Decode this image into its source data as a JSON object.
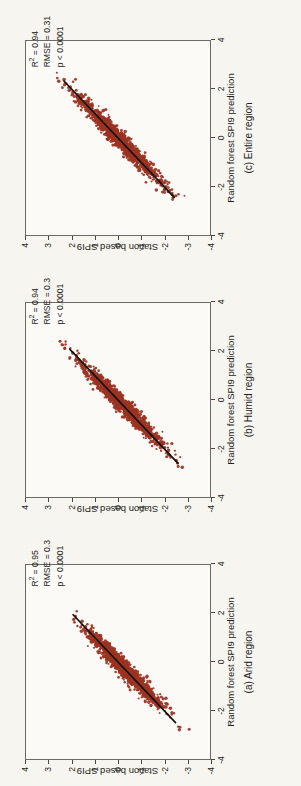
{
  "figure": {
    "orientation": "rotated-90-ccw",
    "background_color": "#f7f5f0",
    "point_color": "#9c3322",
    "line_color": "#141210",
    "axis_color": "#6d6a66"
  },
  "axes": {
    "x_title": "Random forest SPI9 prediction",
    "y_title": "Station based SPI9",
    "x_ticks": [
      "-4",
      "-2",
      "0",
      "2",
      "4"
    ],
    "y_ticks": [
      "-4",
      "-3",
      "-2",
      "-1",
      "0",
      "1",
      "2",
      "3",
      "4"
    ],
    "x_min": -4,
    "x_max": 4,
    "y_min": -4,
    "y_max": 4
  },
  "panels": [
    {
      "id": "c",
      "caption": "(c) Entire region",
      "r2_label": "R",
      "r2_sup": "2",
      "r2_value": " = 0.94",
      "rmse": "RMSE = 0.31",
      "pvalue": "p < 0.0001"
    },
    {
      "id": "b",
      "caption": "(b) Humid region",
      "r2_label": "R",
      "r2_sup": "2",
      "r2_value": " = 0.94",
      "rmse": "RMSE = 0.3",
      "pvalue": "p < 0.0001"
    },
    {
      "id": "a",
      "caption": "(a) Arid region",
      "r2_label": "R",
      "r2_sup": "2",
      "r2_value": " = 0.95",
      "rmse": "RMSE = 0.3",
      "pvalue": "p < 0.0001"
    }
  ],
  "chart_data": [
    {
      "type": "scatter",
      "panel": "c",
      "title": "(c) Entire region",
      "xlabel": "Random forest SPI9 prediction",
      "ylabel": "Station based SPI9",
      "xlim": [
        -4,
        4
      ],
      "ylim": [
        -4,
        4
      ],
      "xticks": [
        -4,
        -2,
        0,
        2,
        4
      ],
      "yticks": [
        -4,
        -3,
        -2,
        -1,
        0,
        1,
        2,
        3,
        4
      ],
      "grid": false,
      "legend": "none",
      "n_points": 1400,
      "r_squared": 0.94,
      "rmse": 0.31,
      "p_value": "< 0.0001",
      "fit_line": {
        "slope": 1.0,
        "intercept": 0.0,
        "x_from": -2.45,
        "x_to": 2.35
      },
      "data_range": {
        "x_from": -2.6,
        "x_to": 2.6,
        "y_from": -2.8,
        "y_to": 2.9
      },
      "residual_sd": 0.31,
      "annotations": [
        "R2 = 0.94",
        "RMSE = 0.31",
        "p < 0.0001"
      ]
    },
    {
      "type": "scatter",
      "panel": "b",
      "title": "(b) Humid region",
      "xlabel": "Random forest SPI9 prediction",
      "ylabel": "Station based SPI9",
      "xlim": [
        -4,
        4
      ],
      "ylim": [
        -4,
        4
      ],
      "xticks": [
        -4,
        -2,
        0,
        2,
        4
      ],
      "yticks": [
        -4,
        -3,
        -2,
        -1,
        0,
        1,
        2,
        3,
        4
      ],
      "grid": false,
      "legend": "none",
      "n_points": 1300,
      "r_squared": 0.94,
      "rmse": 0.3,
      "p_value": "< 0.0001",
      "fit_line": {
        "slope": 1.0,
        "intercept": 0.0,
        "x_from": -2.6,
        "x_to": 2.1
      },
      "data_range": {
        "x_from": -2.7,
        "x_to": 2.4,
        "y_from": -3.0,
        "y_to": 2.9
      },
      "residual_sd": 0.3,
      "annotations": [
        "R2 = 0.94",
        "RMSE = 0.3",
        "p < 0.0001"
      ]
    },
    {
      "type": "scatter",
      "panel": "a",
      "title": "(a) Arid region",
      "xlabel": "Random forest SPI9 prediction",
      "ylabel": "Station based SPI9",
      "xlim": [
        -4,
        4
      ],
      "ylim": [
        -4,
        4
      ],
      "xticks": [
        -4,
        -2,
        0,
        2,
        4
      ],
      "yticks": [
        -4,
        -3,
        -2,
        -1,
        0,
        1,
        2,
        3,
        4
      ],
      "grid": false,
      "legend": "none",
      "n_points": 1350,
      "r_squared": 0.95,
      "rmse": 0.3,
      "p_value": "< 0.0001",
      "fit_line": {
        "slope": 1.0,
        "intercept": 0.0,
        "x_from": -2.5,
        "x_to": 1.95
      },
      "data_range": {
        "x_from": -2.7,
        "x_to": 2.1,
        "y_from": -3.1,
        "y_to": 2.8
      },
      "residual_sd": 0.3,
      "annotations": [
        "R2 = 0.95",
        "RMSE = 0.3",
        "p < 0.0001"
      ]
    }
  ]
}
